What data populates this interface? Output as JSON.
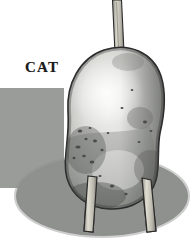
{
  "scene": {
    "title": "CAT",
    "background_color": "#ffffff",
    "width": 196,
    "height": 239
  },
  "label": {
    "text": "CAT"
  },
  "backdrop": {
    "name": "gray-backdrop-block",
    "color": "#9a9c9a",
    "x": 0,
    "y": 88,
    "width": 64,
    "height": 100,
    "corner_radius_bottom_left": 14
  },
  "ground_shadow": {
    "name": "ground-shadow-ellipse",
    "color": "#8f918f",
    "center_x": 102,
    "center_y": 196,
    "radius_x": 86,
    "radius_y": 40
  },
  "body": {
    "name": "potato-body",
    "fill_light": "#e8e8e6",
    "fill_mid": "#b9bab7",
    "fill_dark": "#8a8c89",
    "outline": "#2b2b2b",
    "highlight": "#f2f2f0"
  },
  "top_rod": {
    "name": "vertical-rod",
    "fill": "#c9c7bd",
    "outline": "#2b2b2b",
    "x_top": 113,
    "y_top": 0,
    "x_bottom": 118,
    "y_bottom": 52,
    "width": 9
  },
  "legs": [
    {
      "name": "left-leg-peg",
      "fill": "#cfcdc2",
      "outline": "#2b2b2b",
      "top_x": 90,
      "top_y": 168,
      "bottom_x": 86,
      "bottom_y": 232,
      "width": 9
    },
    {
      "name": "right-leg-peg",
      "fill": "#cfcdc2",
      "outline": "#2b2b2b",
      "top_x": 143,
      "top_y": 165,
      "bottom_x": 151,
      "bottom_y": 232,
      "width": 9
    }
  ],
  "spots": {
    "name": "potato-eye-spots",
    "color": "#4a4c49",
    "count": 18
  }
}
